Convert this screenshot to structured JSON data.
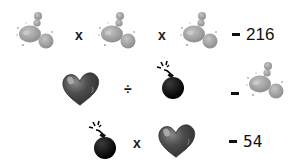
{
  "puzzle": {
    "rows": [
      {
        "terms": [
          "splat",
          "splat",
          "splat"
        ],
        "operators": [
          "x",
          "x"
        ],
        "result": "216"
      },
      {
        "terms": [
          "heart",
          "bomb"
        ],
        "operators": [
          "÷"
        ],
        "result_icon": "splat"
      },
      {
        "terms": [
          "bomb",
          "heart"
        ],
        "operators": [
          "x"
        ],
        "result": "54"
      }
    ]
  },
  "colors": {
    "splat": "#9a9a9a",
    "heart": "#4a4a4a",
    "bomb": "#0d0d0d",
    "text": "#111111"
  }
}
